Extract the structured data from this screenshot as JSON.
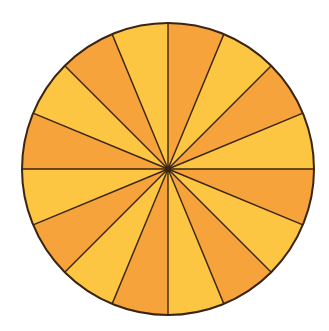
{
  "diagram": {
    "type": "divided-circle",
    "sector_count": 16,
    "start_angle_deg": 0,
    "direction": "clockwise",
    "center": [
      168,
      169
    ],
    "radius": 146,
    "colors": {
      "sector_a": "#F5A33A",
      "sector_b": "#FDC642",
      "stroke": "#3A2412",
      "background": "#FFFFFF"
    },
    "pattern": [
      "sector_a",
      "sector_b"
    ]
  }
}
